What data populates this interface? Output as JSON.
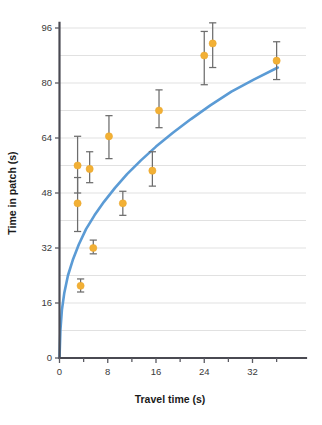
{
  "chart_data": {
    "type": "scatter",
    "title": "",
    "subtitle": "",
    "xlabel": "Travel time (s)",
    "ylabel": "Time in patch (s)",
    "xlim": [
      0,
      37
    ],
    "ylim": [
      0,
      100
    ],
    "xticks": [
      0,
      8,
      16,
      24,
      32
    ],
    "xticklabels": [
      "0",
      "8",
      "16",
      "24",
      "32"
    ],
    "xminorticks": [
      4,
      12,
      20,
      28,
      36
    ],
    "yticks": [
      0,
      16,
      32,
      48,
      64,
      80,
      96
    ],
    "yticklabels": [
      "0",
      "16",
      "32",
      "48",
      "64",
      "80",
      "96"
    ],
    "gridlines_y": [
      8,
      16,
      24,
      32,
      40,
      48,
      56,
      64,
      72,
      80,
      88,
      96
    ],
    "grid": "horizontal",
    "legend": "none",
    "series": [
      {
        "name": "Observed time in patch",
        "marker": "circle",
        "color": "#f2b035",
        "errorbar_color": "#6d6d6d",
        "points": [
          {
            "x": 3.0,
            "y": 56.0,
            "ylow": 48.0,
            "yhigh": 64.5
          },
          {
            "x": 3.0,
            "y": 45.0,
            "ylow": 36.8,
            "yhigh": 52.5
          },
          {
            "x": 3.5,
            "y": 21.0,
            "ylow": 19.2,
            "yhigh": 23.0
          },
          {
            "x": 5.0,
            "y": 55.0,
            "ylow": 51.0,
            "yhigh": 60.0
          },
          {
            "x": 5.6,
            "y": 32.0,
            "ylow": 30.3,
            "yhigh": 34.3
          },
          {
            "x": 8.2,
            "y": 64.5,
            "ylow": 58.0,
            "yhigh": 70.5
          },
          {
            "x": 10.5,
            "y": 45.0,
            "ylow": 41.5,
            "yhigh": 48.5
          },
          {
            "x": 15.4,
            "y": 54.5,
            "ylow": 50.0,
            "yhigh": 60.0
          },
          {
            "x": 16.5,
            "y": 72.0,
            "ylow": 67.0,
            "yhigh": 78.0
          },
          {
            "x": 24.0,
            "y": 88.0,
            "ylow": 79.5,
            "yhigh": 95.0
          },
          {
            "x": 25.4,
            "y": 91.5,
            "ylow": 84.5,
            "yhigh": 97.5
          },
          {
            "x": 36.0,
            "y": 86.5,
            "ylow": 81.0,
            "yhigh": 92.0
          }
        ]
      },
      {
        "name": "Marginal value theorem fit",
        "type": "line",
        "color": "#5b9bd5",
        "curve": [
          {
            "x": 0.0,
            "y": 0.0
          },
          {
            "x": 0.15,
            "y": 8.0
          },
          {
            "x": 0.4,
            "y": 14.0
          },
          {
            "x": 0.8,
            "y": 19.0
          },
          {
            "x": 1.4,
            "y": 24.0
          },
          {
            "x": 2.2,
            "y": 28.5
          },
          {
            "x": 3.2,
            "y": 33.0
          },
          {
            "x": 4.4,
            "y": 37.5
          },
          {
            "x": 5.8,
            "y": 41.5
          },
          {
            "x": 7.4,
            "y": 45.5
          },
          {
            "x": 9.2,
            "y": 49.5
          },
          {
            "x": 11.2,
            "y": 53.5
          },
          {
            "x": 13.5,
            "y": 57.5
          },
          {
            "x": 16.0,
            "y": 61.5
          },
          {
            "x": 18.8,
            "y": 65.5
          },
          {
            "x": 21.8,
            "y": 69.5
          },
          {
            "x": 25.0,
            "y": 73.5
          },
          {
            "x": 28.5,
            "y": 77.5
          },
          {
            "x": 32.2,
            "y": 81.0
          },
          {
            "x": 36.2,
            "y": 84.5
          }
        ]
      }
    ]
  }
}
